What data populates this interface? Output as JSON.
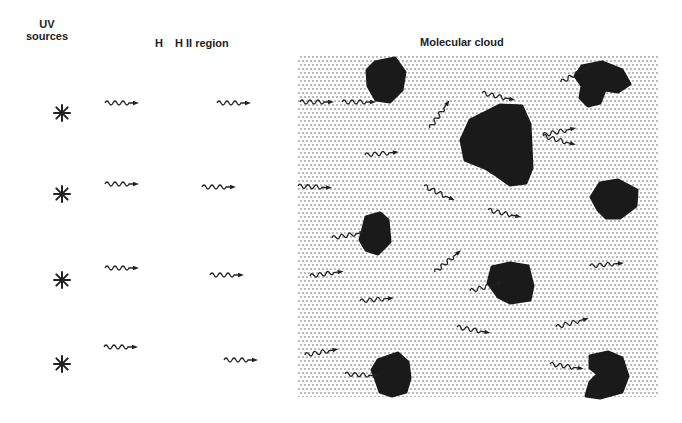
{
  "labels": {
    "uv_line1": "UV",
    "uv_line2": "sources",
    "h": "H",
    "hii_region": "H II region",
    "molecular_cloud": "Molecular cloud"
  },
  "colors": {
    "ink": "#222222",
    "clump": "#1a1a1a",
    "dot": "#9a9a9a",
    "background": "#ffffff"
  },
  "cloud": {
    "x": 298,
    "y": 55,
    "width": 360,
    "height": 342,
    "dot_spacing": 4
  },
  "uv_sources": [
    {
      "x": 62,
      "y": 113
    },
    {
      "x": 62,
      "y": 194
    },
    {
      "x": 62,
      "y": 280
    },
    {
      "x": 62,
      "y": 364
    }
  ],
  "photons": [
    {
      "x": 105,
      "y": 103,
      "angle": 0
    },
    {
      "x": 217,
      "y": 103,
      "angle": 0
    },
    {
      "x": 105,
      "y": 184,
      "angle": 0
    },
    {
      "x": 202,
      "y": 187,
      "angle": 0
    },
    {
      "x": 105,
      "y": 268,
      "angle": 0
    },
    {
      "x": 210,
      "y": 275,
      "angle": 0
    },
    {
      "x": 104,
      "y": 347,
      "angle": 0
    },
    {
      "x": 224,
      "y": 360,
      "angle": 0
    },
    {
      "x": 300,
      "y": 102,
      "angle": 0
    },
    {
      "x": 342,
      "y": 102,
      "angle": 0
    },
    {
      "x": 430,
      "y": 128,
      "angle": -55
    },
    {
      "x": 482,
      "y": 93,
      "angle": 12
    },
    {
      "x": 365,
      "y": 155,
      "angle": -5
    },
    {
      "x": 298,
      "y": 186,
      "angle": 3
    },
    {
      "x": 424,
      "y": 186,
      "angle": 25
    },
    {
      "x": 488,
      "y": 210,
      "angle": 12
    },
    {
      "x": 543,
      "y": 135,
      "angle": -12
    },
    {
      "x": 561,
      "y": 82,
      "angle": -28
    },
    {
      "x": 543,
      "y": 136,
      "angle": 15
    },
    {
      "x": 332,
      "y": 238,
      "angle": -10
    },
    {
      "x": 435,
      "y": 272,
      "angle": -40
    },
    {
      "x": 310,
      "y": 276,
      "angle": -8
    },
    {
      "x": 360,
      "y": 301,
      "angle": -5
    },
    {
      "x": 470,
      "y": 291,
      "angle": -15
    },
    {
      "x": 590,
      "y": 266,
      "angle": -5
    },
    {
      "x": 457,
      "y": 327,
      "angle": 10
    },
    {
      "x": 556,
      "y": 327,
      "angle": -15
    },
    {
      "x": 305,
      "y": 355,
      "angle": -10
    },
    {
      "x": 345,
      "y": 374,
      "angle": 3
    },
    {
      "x": 550,
      "y": 364,
      "angle": 8
    }
  ],
  "clumps": [
    "M375,62 L395,58 L405,72 L402,90 L390,102 L376,100 L368,86 L367,70 Z",
    "M582,66 L602,62 L622,70 L630,84 L618,92 L605,90 L600,103 L588,106 L580,98 L582,86 L575,76 Z",
    "M470,120 L500,105 L522,106 L530,124 L532,168 L526,183 L510,185 L496,175 L485,168 L465,160 L461,140 Z",
    "M600,183 L618,180 L637,190 L636,206 L620,218 L606,218 L598,210 L591,197 Z",
    "M366,217 L380,213 L388,220 L390,242 L378,254 L366,250 L360,240 Z",
    "M492,267 L510,263 L528,266 L533,286 L530,300 L510,303 L498,297 L488,283 Z",
    "M378,360 L398,353 L408,362 L410,378 L406,392 L392,396 L380,392 L376,380 L372,370 Z",
    "M590,356 L608,352 L622,358 L628,376 L622,392 L600,398 L586,396 L590,382 L598,374 L590,368 Z"
  ]
}
